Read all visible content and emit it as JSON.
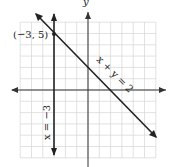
{
  "chart_data": {
    "type": "line",
    "title": "",
    "xlabel": "x",
    "ylabel": "y",
    "xlim": [
      -6,
      6
    ],
    "ylim": [
      -6,
      6
    ],
    "grid": true,
    "series": [
      {
        "name": "x + y = 2",
        "equation": "x + y = 2",
        "points": [
          [
            -4,
            6
          ],
          [
            6,
            -4
          ]
        ]
      },
      {
        "name": "x = -3",
        "equation": "x = -3",
        "points": [
          [
            -3,
            6
          ],
          [
            -3,
            -6
          ]
        ]
      }
    ],
    "annotations": [
      {
        "text": "(−3, 5)",
        "x": -3,
        "y": 5
      }
    ]
  },
  "labels": {
    "line1": "x + y = 2",
    "line2": "x = −3",
    "point": "(−3, 5)",
    "y_axis": "y"
  }
}
